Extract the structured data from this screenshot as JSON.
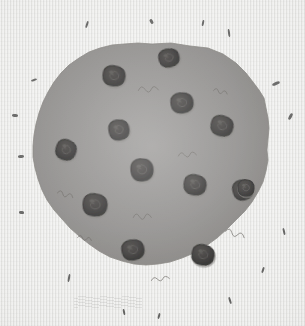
{
  "artwork": {
    "title": "Chocolate Chip Cookie",
    "subject": "cookie",
    "medium": "pencil drawing on laid paper",
    "alt_text": "A large round lumpy chocolate chip cookie drawn in gray pencil on textured off-white paper, with thirteen dark chocolate chips and small scattered crumb marks around it.",
    "canvas": {
      "width": 305,
      "height": 326
    }
  },
  "colors": {
    "paper_background": "#e9e9e7",
    "paper_line_light": "#ffffff",
    "paper_line_dark": "#cdcdca",
    "cookie_body": "#807e7c",
    "cookie_body_shadow": "#75736f",
    "cookie_body_highlight": "#8a8886",
    "cookie_edge": "#6e6c69",
    "chip_fill": "#23211f",
    "chip_dark": "#141312",
    "chip_swirl": "#4a4744",
    "crumb_mark": "#3a3a38",
    "smudge": "#96968f"
  },
  "cookie": {
    "label": "cookie-body",
    "center": {
      "x": 152,
      "y": 163
    },
    "radius_avg": 117,
    "outline_path": "M 152 44 L 171 43 L 190 46 L 208 48 L 223 54 L 236 63 L 246 73 L 253 82 L 259 90 L 264 98 L 266 108 L 268 118 L 269 128 L 268 139 L 267 150 L 268 160 L 266 171 L 263 182 L 258 192 L 252 202 L 245 211 L 236 220 L 227 229 L 217 238 L 206 246 L 194 253 L 182 258 L 170 262 L 158 264 L 146 265 L 134 264 L 122 261 L 110 257 L 99 251 L 89 244 L 79 236 L 70 228 L 62 219 L 54 210 L 47 200 L 42 190 L 38 179 L 35 168 L 33 157 L 33 146 L 34 135 L 36 124 L 39 113 L 43 102 L 48 92 L 54 82 L 61 73 L 69 65 L 79 58 L 89 52 L 100 48 L 112 45 L 124 44 L 138 43 Z"
  },
  "chocolate_chips": {
    "count": 13,
    "label": "chocolate-chip",
    "items": [
      {
        "id": 1,
        "name": "chip-top-center",
        "cx": 169,
        "cy": 58,
        "rx": 10,
        "ry": 9,
        "rot": -12
      },
      {
        "id": 2,
        "name": "chip-upper-left",
        "cx": 114,
        "cy": 76,
        "rx": 11,
        "ry": 10,
        "rot": 8
      },
      {
        "id": 3,
        "name": "chip-upper-right",
        "cx": 182,
        "cy": 103,
        "rx": 11,
        "ry": 10,
        "rot": -5
      },
      {
        "id": 4,
        "name": "chip-right-upper",
        "cx": 222,
        "cy": 126,
        "rx": 11,
        "ry": 10,
        "rot": 15
      },
      {
        "id": 5,
        "name": "chip-mid-left-inner",
        "cx": 119,
        "cy": 130,
        "rx": 10,
        "ry": 10,
        "rot": -8
      },
      {
        "id": 6,
        "name": "chip-far-left",
        "cx": 66,
        "cy": 150,
        "rx": 10,
        "ry": 10,
        "rot": 20
      },
      {
        "id": 7,
        "name": "chip-center",
        "cx": 142,
        "cy": 170,
        "rx": 11,
        "ry": 11,
        "rot": -3
      },
      {
        "id": 8,
        "name": "chip-right-center",
        "cx": 195,
        "cy": 185,
        "rx": 11,
        "ry": 10,
        "rot": 10
      },
      {
        "id": 9,
        "name": "chip-far-right",
        "cx": 243,
        "cy": 190,
        "rx": 10,
        "ry": 10,
        "rot": -14
      },
      {
        "id": 10,
        "name": "chip-lower-left",
        "cx": 95,
        "cy": 205,
        "rx": 12,
        "ry": 11,
        "rot": 6
      },
      {
        "id": 11,
        "name": "chip-bottom-left",
        "cx": 133,
        "cy": 250,
        "rx": 11,
        "ry": 10,
        "rot": -9
      },
      {
        "id": 12,
        "name": "chip-bottom-right",
        "cx": 203,
        "cy": 255,
        "rx": 11,
        "ry": 10,
        "rot": 12
      },
      {
        "id": 13,
        "name": "chip-right-edge-small",
        "cx": 246,
        "cy": 188,
        "rx": 8,
        "ry": 8,
        "rot": 0
      }
    ]
  },
  "surface_marks": {
    "label": "pencil-squiggle",
    "items": [
      {
        "name": "squiggle-top-center",
        "x": 138,
        "y": 87,
        "w": 20,
        "h": 7,
        "rot": -6
      },
      {
        "name": "squiggle-upper-right",
        "x": 214,
        "y": 88,
        "w": 14,
        "h": 5,
        "rot": 10
      },
      {
        "name": "squiggle-mid-right",
        "x": 178,
        "y": 153,
        "w": 18,
        "h": 6,
        "rot": -8
      },
      {
        "name": "squiggle-mid-left",
        "x": 58,
        "y": 190,
        "w": 16,
        "h": 6,
        "rot": 12
      },
      {
        "name": "squiggle-center-low",
        "x": 133,
        "y": 214,
        "w": 18,
        "h": 7,
        "rot": -5
      },
      {
        "name": "squiggle-lower-right",
        "x": 226,
        "y": 228,
        "w": 20,
        "h": 7,
        "rot": 14
      },
      {
        "name": "squiggle-bottom",
        "x": 151,
        "y": 278,
        "w": 18,
        "h": 5,
        "rot": -10
      },
      {
        "name": "squiggle-left-low",
        "x": 78,
        "y": 235,
        "w": 14,
        "h": 5,
        "rot": 8
      }
    ]
  },
  "crumbs": {
    "label": "crumb-fleck",
    "items": [
      {
        "name": "crumb-top-1",
        "x": 86,
        "y": 21,
        "w": 2,
        "h": 7,
        "rot": 18
      },
      {
        "name": "crumb-top-2",
        "x": 150,
        "y": 19,
        "w": 3,
        "h": 5,
        "rot": -32
      },
      {
        "name": "crumb-top-3",
        "x": 202,
        "y": 20,
        "w": 2,
        "h": 6,
        "rot": 12
      },
      {
        "name": "crumb-top-4",
        "x": 228,
        "y": 29,
        "w": 2,
        "h": 8,
        "rot": -8
      },
      {
        "name": "crumb-left-1",
        "x": 31,
        "y": 79,
        "w": 6,
        "h": 2,
        "rot": -16
      },
      {
        "name": "crumb-left-2",
        "x": 12,
        "y": 114,
        "w": 6,
        "h": 3,
        "rot": 4
      },
      {
        "name": "crumb-left-3",
        "x": 18,
        "y": 155,
        "w": 6,
        "h": 3,
        "rot": -5
      },
      {
        "name": "crumb-left-4",
        "x": 19,
        "y": 211,
        "w": 5,
        "h": 3,
        "rot": 8
      },
      {
        "name": "crumb-right-1",
        "x": 272,
        "y": 82,
        "w": 8,
        "h": 3,
        "rot": -22
      },
      {
        "name": "crumb-right-2",
        "x": 289,
        "y": 113,
        "w": 3,
        "h": 7,
        "rot": 28
      },
      {
        "name": "crumb-right-3",
        "x": 283,
        "y": 228,
        "w": 2,
        "h": 7,
        "rot": -14
      },
      {
        "name": "crumb-bottom-1",
        "x": 68,
        "y": 274,
        "w": 2,
        "h": 8,
        "rot": 10
      },
      {
        "name": "crumb-bottom-2",
        "x": 123,
        "y": 309,
        "w": 2,
        "h": 6,
        "rot": -12
      },
      {
        "name": "crumb-bottom-3",
        "x": 158,
        "y": 313,
        "w": 2,
        "h": 6,
        "rot": 14
      },
      {
        "name": "crumb-bottom-4",
        "x": 229,
        "y": 297,
        "w": 2,
        "h": 7,
        "rot": -18
      },
      {
        "name": "crumb-bottom-5",
        "x": 262,
        "y": 267,
        "w": 2,
        "h": 6,
        "rot": 20
      }
    ]
  },
  "smudge": {
    "name": "erased-pencil-smudge",
    "x": 74,
    "y": 296,
    "w": 68,
    "h": 12
  }
}
